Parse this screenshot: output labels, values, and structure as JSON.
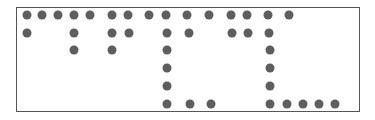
{
  "figure": {
    "frame": {
      "left": 16,
      "top": 7,
      "right": 361,
      "bottom": 113
    },
    "dot_color": "#5e5e5e",
    "dot_diameter": 9,
    "dots": [
      [
        27,
        15
      ],
      [
        42,
        15
      ],
      [
        58,
        15
      ],
      [
        74,
        15
      ],
      [
        90,
        15
      ],
      [
        112,
        15
      ],
      [
        128,
        15
      ],
      [
        149,
        15
      ],
      [
        166,
        15
      ],
      [
        187,
        15
      ],
      [
        209,
        15
      ],
      [
        231,
        15
      ],
      [
        247,
        15
      ],
      [
        268,
        15
      ],
      [
        289,
        15
      ],
      [
        27,
        33
      ],
      [
        74,
        33
      ],
      [
        112,
        33
      ],
      [
        129,
        33
      ],
      [
        167,
        33
      ],
      [
        189,
        33
      ],
      [
        232,
        33
      ],
      [
        248,
        33
      ],
      [
        269,
        33
      ],
      [
        74,
        50
      ],
      [
        112,
        50
      ],
      [
        167,
        50
      ],
      [
        270,
        50
      ],
      [
        167,
        68
      ],
      [
        270,
        68
      ],
      [
        167,
        86
      ],
      [
        270,
        86
      ],
      [
        167,
        104
      ],
      [
        190,
        104
      ],
      [
        211,
        104
      ],
      [
        270,
        104
      ],
      [
        287,
        104
      ],
      [
        303,
        104
      ],
      [
        319,
        104
      ],
      [
        335,
        104
      ]
    ]
  }
}
